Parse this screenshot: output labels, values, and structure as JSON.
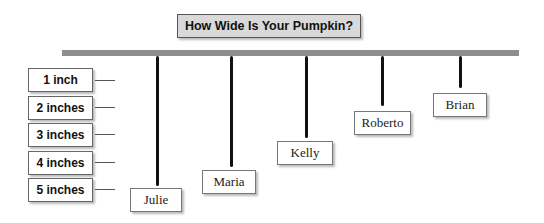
{
  "title": "How Wide Is Your Pumpkin?",
  "scale": [
    {
      "label": "1 inch"
    },
    {
      "label": "2 inches"
    },
    {
      "label": "3 inches"
    },
    {
      "label": "4 inches"
    },
    {
      "label": "5 inches"
    }
  ],
  "pumpkins": [
    {
      "name": "Julie",
      "inches": 5
    },
    {
      "name": "Maria",
      "inches": 4.5
    },
    {
      "name": "Kelly",
      "inches": 3.7
    },
    {
      "name": "Roberto",
      "inches": 2.5
    },
    {
      "name": "Brian",
      "inches": 1.5
    }
  ],
  "colors": {
    "bar": "#8e8e8e",
    "title_bg": "#d9d9d9",
    "string": "#111111"
  }
}
